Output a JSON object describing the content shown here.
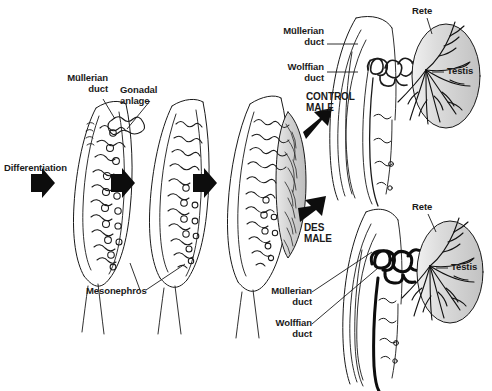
{
  "figure": {
    "background_color": "#ffffff",
    "ink_color": "#1a1a1a",
    "gonad_fill": "#d4d4d4",
    "testis_fill": "#d8d8d8"
  },
  "labels": {
    "differentiation": "Differentiation",
    "mullerian_duct": "Müllerian\nduct",
    "gonadal_anlage": "Gonadal\nanlage",
    "mesonephros": "Mesonephros",
    "mullerian_duct_top": "Müllerian\nduct",
    "wolffian_duct_top": "Wolffian\nduct",
    "control_male": "CONTROL\nMALE",
    "des_male": "DES\nMALE",
    "rete_top": "Rete",
    "testis_top": "Testis",
    "rete_bottom": "Rete",
    "testis_bottom": "Testis",
    "mullerian_duct_bottom": "Müllerian\nduct",
    "wolffian_duct_bottom": "Wolffian\nduct"
  },
  "panels": [
    {
      "name": "stage-1-indifferent-gonad",
      "stage": 1,
      "description": "Indifferent gonad with mesonephric tubules and glomeruli, Müllerian duct along outer edge, gonadal anlage as ridge"
    },
    {
      "name": "stage-2-early-differentiation",
      "stage": 2,
      "description": "Mesonephros with regressing tubules, gonad beginning to organize"
    },
    {
      "name": "stage-3-gonad-shaded",
      "stage": 3,
      "description": "Gonad shaded gray, tubules condensing toward rete region"
    },
    {
      "name": "control-male-outcome",
      "stage": 4,
      "description": "Control male: thin coiled epididymal duct, regressed Müllerian duct, oval testis with dendritic rete"
    },
    {
      "name": "des-male-outcome",
      "stage": 5,
      "description": "DES male: thickened bold Wolffian duct, retained Müllerian duct, oval testis with dendritic rete"
    }
  ],
  "arrows": [
    {
      "name": "arrow-stage-1",
      "direction": "right"
    },
    {
      "name": "arrow-stage-2",
      "direction": "right"
    },
    {
      "name": "arrow-stage-3",
      "direction": "right"
    },
    {
      "name": "arrow-control-male",
      "direction": "up-right"
    },
    {
      "name": "arrow-des-male",
      "direction": "down-right"
    }
  ]
}
